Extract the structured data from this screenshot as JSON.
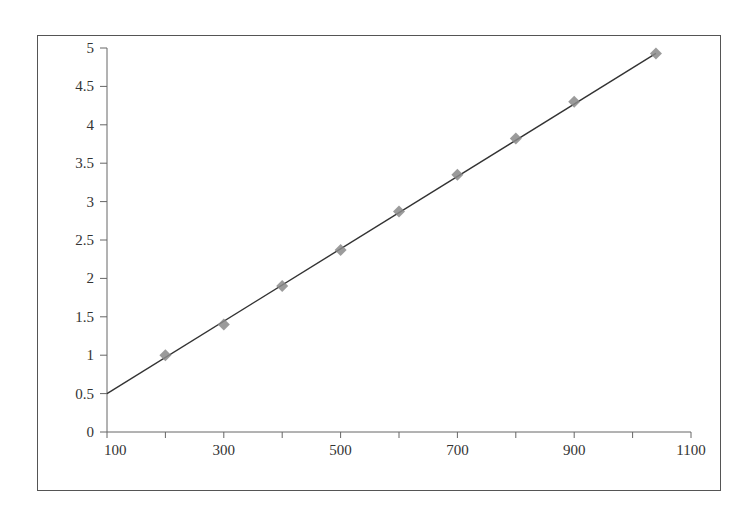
{
  "chart_data": {
    "type": "scatter",
    "title": "",
    "xlabel": "",
    "ylabel": "",
    "xlim": [
      100,
      1100
    ],
    "ylim": [
      0,
      5
    ],
    "x_tick_labels": [
      "100",
      "300",
      "500",
      "700",
      "900",
      "1100"
    ],
    "x_minor_ticks": [
      200,
      400,
      600,
      800,
      1000
    ],
    "y_tick_labels": [
      "0",
      "0.5",
      "1",
      "1.5",
      "2",
      "2.5",
      "3",
      "3.5",
      "4",
      "4.5",
      "5"
    ],
    "grid": false,
    "legend": null,
    "series": [
      {
        "name": "data points",
        "marker": "diamond",
        "color": "#8a8a8a",
        "x": [
          200,
          300,
          400,
          500,
          600,
          700,
          800,
          900,
          1040
        ],
        "y": [
          1.0,
          1.4,
          1.9,
          2.37,
          2.87,
          3.35,
          3.82,
          4.3,
          4.93
        ]
      },
      {
        "name": "linear fit",
        "type": "line",
        "color": "#333333",
        "x": [
          100,
          1040
        ],
        "y": [
          0.5,
          4.93
        ]
      }
    ]
  }
}
